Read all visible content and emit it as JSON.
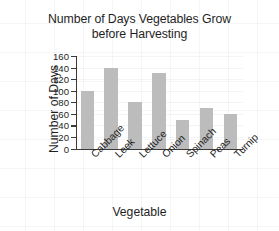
{
  "chart_data": {
    "type": "bar",
    "title": "Number of Days Vegetables Grow\nbefore Harvesting",
    "title_line1": "Number of Days Vegetables Grow",
    "title_line2": "before Harvesting",
    "xlabel": "Vegetable",
    "ylabel": "Number of Days",
    "categories": [
      "Cabbage",
      "Leek",
      "Lettuce",
      "Onion",
      "Spinach",
      "Peas",
      "Turnip"
    ],
    "values": [
      100,
      140,
      80,
      130,
      49,
      70,
      59
    ],
    "ylim": [
      0,
      160
    ],
    "ytick_step": 20,
    "yticks": [
      0,
      20,
      40,
      60,
      80,
      100,
      120,
      140,
      160
    ],
    "ytick_labels": [
      "0",
      "20",
      "40",
      "60",
      "80",
      "100",
      "120",
      "140",
      "160"
    ],
    "grid": false,
    "legend": false,
    "legend_position": "none",
    "bar_color": "#bcbcbc",
    "axis_color": "#3a3a3a",
    "background_color": "#ffffff",
    "text_color": "#1f1f1f",
    "category_label_rotation": -45
  }
}
